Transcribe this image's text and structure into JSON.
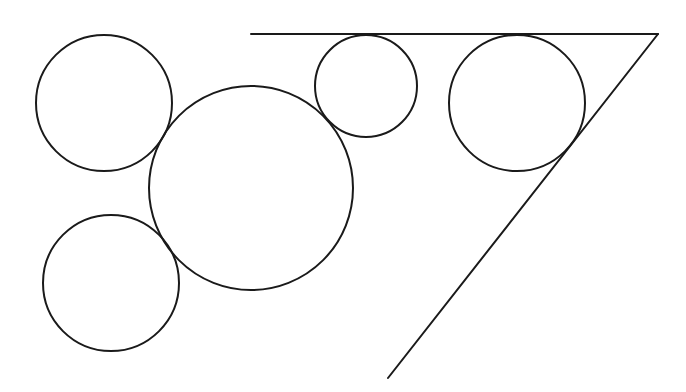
{
  "diagram": {
    "title": "",
    "canvas": {
      "width": 686,
      "height": 392,
      "background": "#ffffff"
    },
    "stroke_color": "#1a1a1a",
    "stroke_width": 2,
    "lines": [
      {
        "id": "top-line",
        "x1": 251,
        "y1": 34,
        "x2": 658,
        "y2": 34
      },
      {
        "id": "diagonal-line",
        "x1": 658,
        "y1": 34,
        "x2": 388,
        "y2": 378
      }
    ],
    "circles": [
      {
        "id": "circle-top-left",
        "cx": 104,
        "cy": 103,
        "r": 68
      },
      {
        "id": "circle-large-center",
        "cx": 251,
        "cy": 188,
        "r": 102
      },
      {
        "id": "circle-small-top",
        "cx": 366,
        "cy": 86,
        "r": 51
      },
      {
        "id": "circle-right-corner",
        "cx": 517,
        "cy": 103,
        "r": 68
      },
      {
        "id": "circle-bottom-left",
        "cx": 111,
        "cy": 283,
        "r": 68
      }
    ]
  }
}
